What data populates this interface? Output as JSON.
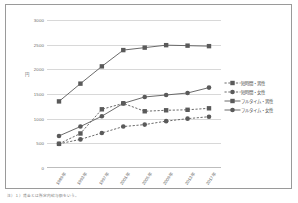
{
  "figure": {
    "yaxis_title": "円",
    "footnote": "注）１）賃金とは所定内給与額をいう。"
  },
  "legend": {
    "position": "right",
    "items": [
      {
        "label": "短時間・男性",
        "marker": "square",
        "line": "dashed",
        "color": "#5a5a5a"
      },
      {
        "label": "短時間・女性",
        "marker": "circle",
        "line": "dashed",
        "color": "#5a5a5a"
      },
      {
        "label": "フルタイム・男性",
        "marker": "square",
        "line": "solid",
        "color": "#5a5a5a"
      },
      {
        "label": "フルタイム・女性",
        "marker": "circle",
        "line": "solid",
        "color": "#5a5a5a"
      }
    ]
  },
  "chart_data": {
    "type": "line",
    "title": "",
    "xlabel": "",
    "ylabel": "円",
    "ylim": [
      0,
      3000
    ],
    "ytick_labels": [
      "0",
      "500",
      "1000",
      "1500",
      "2000",
      "2500",
      "3000"
    ],
    "ytick_values": [
      0,
      500,
      1000,
      1500,
      2000,
      2500,
      3000
    ],
    "grid": true,
    "categories": [
      "1989年",
      "1993年",
      "1997年",
      "2001年",
      "2005年",
      "2009年",
      "2013年",
      "2017年"
    ],
    "series": [
      {
        "name": "フルタイム・男性",
        "marker": "square",
        "line": "solid",
        "values": [
          1350,
          1710,
          2060,
          2390,
          2440,
          2490,
          2480,
          2470
        ]
      },
      {
        "name": "フルタイム・女性",
        "marker": "circle",
        "line": "solid",
        "values": [
          650,
          840,
          1050,
          1310,
          1440,
          1480,
          1520,
          1630
        ]
      },
      {
        "name": "短時間・男性",
        "marker": "square",
        "line": "dashed",
        "values": [
          490,
          700,
          1190,
          1310,
          1150,
          1170,
          1180,
          1210
        ]
      },
      {
        "name": "短時間・女性",
        "marker": "circle",
        "line": "dashed",
        "values": [
          490,
          580,
          710,
          840,
          880,
          950,
          1000,
          1040
        ]
      }
    ]
  }
}
